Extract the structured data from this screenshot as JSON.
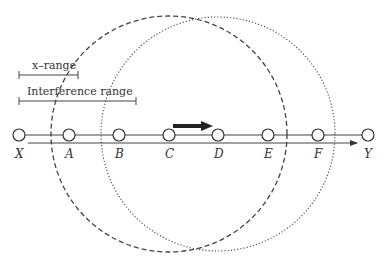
{
  "diagram": {
    "legend": {
      "x_range_label": "x–range",
      "interference_range_label": "Interference range"
    },
    "nodes": [
      {
        "id": "X",
        "label": "X",
        "x": 19
      },
      {
        "id": "A",
        "label": "A",
        "x": 69
      },
      {
        "id": "B",
        "label": "B",
        "x": 119
      },
      {
        "id": "C",
        "label": "C",
        "x": 169
      },
      {
        "id": "D",
        "label": "D",
        "x": 218
      },
      {
        "id": "E",
        "label": "E",
        "x": 268
      },
      {
        "id": "F",
        "label": "F",
        "x": 318
      },
      {
        "id": "Y",
        "label": "Y",
        "x": 368
      }
    ],
    "transmission": {
      "from": "C",
      "to": "D"
    },
    "circles": [
      {
        "center": "C",
        "style": "dashed"
      },
      {
        "center": "D",
        "style": "dotted"
      }
    ],
    "colors": {
      "stroke": "#333333",
      "arrow": "#222222",
      "background": "#ffffff"
    }
  }
}
